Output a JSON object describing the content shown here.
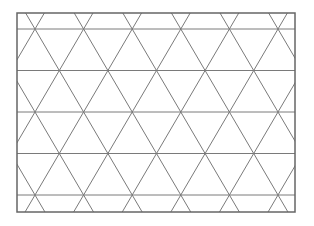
{
  "diagram": {
    "type": "triangular-grid",
    "frame": {
      "x": 17,
      "y": 13,
      "width": 278,
      "height": 199,
      "stroke": "#666666",
      "stroke_width": 1.5
    },
    "grid": {
      "stroke": "#7a7a7a",
      "stroke_width": 1,
      "horizontal_lines_y": [
        29,
        70.5,
        112,
        153.5,
        195
      ],
      "row_spacing": 41.5,
      "vertex_spacing_x": 48.6,
      "vertex_origin": {
        "x": 35,
        "y": 29
      }
    }
  }
}
